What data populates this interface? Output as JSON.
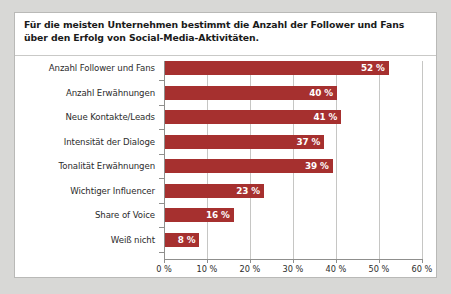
{
  "title": "Für die meisten Unternehmen bestimmt die Anzahl der Follower und Fans über den Erfolg von Social-Media-Aktivitäten.",
  "colors": {
    "bar": "#a6302f",
    "value_label": "#ffffff",
    "category_label": "#2b2b2b",
    "title": "#1a1a1a",
    "gridline": "#c6c6c4",
    "axis": "#8f8f8d",
    "plot_background": "#ffffff",
    "page_background": "#d8d8d6"
  },
  "chart_data": {
    "type": "bar",
    "orientation": "horizontal",
    "title": "Für die meisten Unternehmen bestimmt die Anzahl der Follower und Fans über den Erfolg von Social-Media-Aktivitäten.",
    "xlabel": "",
    "ylabel": "",
    "xlim": [
      0,
      60
    ],
    "grid": true,
    "legend": "none",
    "categories": [
      "Anzahl Follower und Fans",
      "Anzahl Erwähnungen",
      "Neue Kontakte/Leads",
      "Intensität der Dialoge",
      "Tonalität Erwähnungen",
      "Wichtiger Influencer",
      "Share of Voice",
      "Weiß nicht"
    ],
    "values": [
      52,
      40,
      41,
      37,
      39,
      23,
      16,
      8
    ],
    "value_labels": [
      "52 %",
      "40 %",
      "41 %",
      "37 %",
      "39 %",
      "23 %",
      "16 %",
      "8 %"
    ],
    "xticks": [
      0,
      10,
      20,
      30,
      40,
      50,
      60
    ],
    "xtick_labels": [
      "0 %",
      "10 %",
      "20 %",
      "30 %",
      "40 %",
      "50 %",
      "60 %"
    ]
  }
}
